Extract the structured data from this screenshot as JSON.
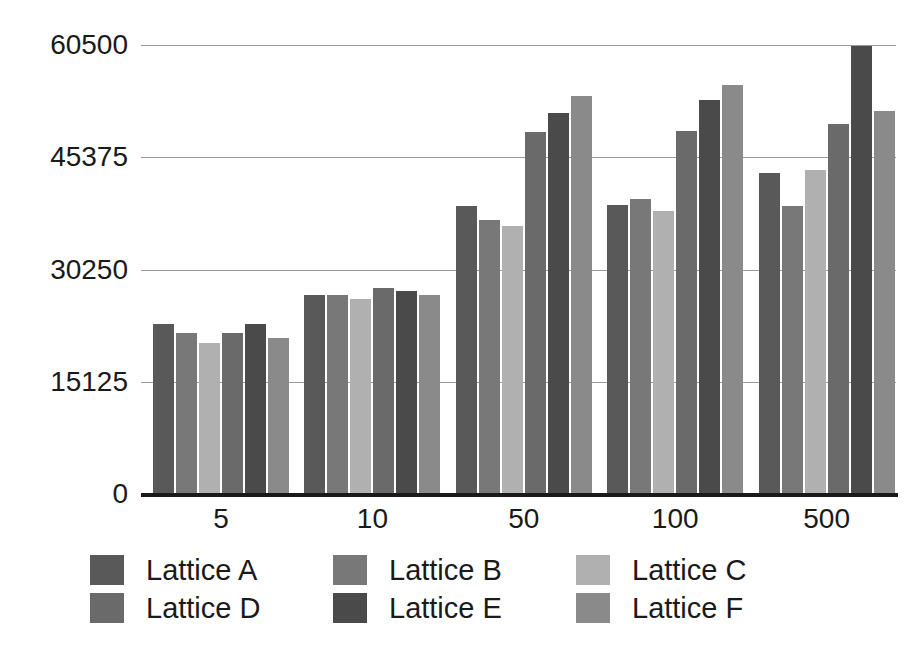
{
  "chart_data": {
    "type": "bar",
    "title": "",
    "subtitle": "",
    "xlabel": "",
    "ylabel": "",
    "categories": [
      "5",
      "10",
      "50",
      "100",
      "500"
    ],
    "series": [
      {
        "name": "Lattice A",
        "color": "#595959",
        "values": [
          22950,
          26800,
          38850,
          38900,
          43300
        ]
      },
      {
        "name": "Lattice B",
        "color": "#787878",
        "values": [
          21650,
          26800,
          36950,
          39700,
          38750
        ]
      },
      {
        "name": "Lattice C",
        "color": "#b0b0b0",
        "values": [
          20400,
          26300,
          36050,
          38100,
          43700
        ]
      },
      {
        "name": "Lattice D",
        "color": "#6a6a6a",
        "values": [
          21650,
          27700,
          48750,
          48950,
          49800
        ]
      },
      {
        "name": "Lattice E",
        "color": "#4a4a4a",
        "values": [
          22950,
          27350,
          51350,
          53150,
          60400
        ]
      },
      {
        "name": "Lattice F",
        "color": "#8a8a8a",
        "values": [
          21050,
          26850,
          53600,
          55050,
          51550
        ]
      }
    ],
    "ylim": [
      0,
      60500
    ],
    "yticks": [
      0,
      15125,
      30250,
      45375,
      60500
    ],
    "ytick_labels": [
      "0",
      "15125",
      "30250",
      "45375",
      "60500"
    ],
    "xtick_labels": [
      "5",
      "10",
      "50",
      "100",
      "500"
    ],
    "grid": true,
    "grid_color": "#9a9a9a",
    "legend_position": "bottom",
    "axis_color": "#1a1a1a",
    "background": "#ffffff"
  },
  "legend": {
    "items": [
      {
        "label": "Lattice A",
        "color": "#595959"
      },
      {
        "label": "Lattice B",
        "color": "#787878"
      },
      {
        "label": "Lattice C",
        "color": "#b0b0b0"
      },
      {
        "label": "Lattice D",
        "color": "#6a6a6a"
      },
      {
        "label": "Lattice E",
        "color": "#4a4a4a"
      },
      {
        "label": "Lattice F",
        "color": "#8a8a8a"
      }
    ]
  }
}
